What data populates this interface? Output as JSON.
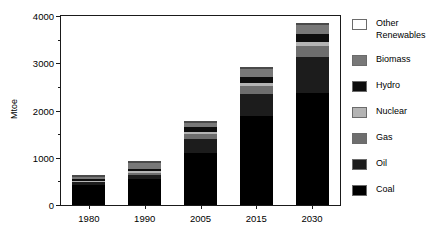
{
  "chart_data": {
    "type": "bar",
    "subtype": "stacked-bar",
    "title": "",
    "xlabel": "",
    "ylabel": "Mtoe",
    "ylim": [
      0,
      4000
    ],
    "yticks": [
      0,
      1000,
      2000,
      3000,
      4000
    ],
    "ytick_labels": [
      "0",
      "1000",
      "2000",
      "3000",
      "4000"
    ],
    "yminor_ticks": [
      500,
      1500,
      2500,
      3500
    ],
    "grid": false,
    "legend_position": "right",
    "categories": [
      "1980",
      "1990",
      "2005",
      "2015",
      "2030"
    ],
    "series": [
      {
        "name": "Coal",
        "color": "#000000",
        "values": [
          430,
          560,
          1100,
          1880,
          2380
        ]
      },
      {
        "name": "Oil",
        "color": "#1c1c1c",
        "values": [
          60,
          85,
          300,
          460,
          760
        ]
      },
      {
        "name": "Gas",
        "color": "#6e6e6e",
        "values": [
          20,
          40,
          110,
          180,
          230
        ]
      },
      {
        "name": "Nuclear",
        "color": "#b4b4b4",
        "values": [
          5,
          25,
          45,
          70,
          90
        ]
      },
      {
        "name": "Hydro",
        "color": "#0d0d0d",
        "values": [
          45,
          60,
          100,
          120,
          150
        ]
      },
      {
        "name": "Biomass",
        "color": "#787878",
        "values": [
          40,
          120,
          90,
          160,
          200
        ]
      },
      {
        "name": "Other Renewables",
        "color": "#ffffff",
        "values": [
          5,
          10,
          15,
          30,
          50
        ]
      }
    ],
    "totals": [
      605,
      900,
      1760,
      2900,
      3860
    ]
  },
  "legend": {
    "items": [
      {
        "label": "Other\nRenewables",
        "name": "other-renewables"
      },
      {
        "label": "Biomass",
        "name": "biomass"
      },
      {
        "label": "Hydro",
        "name": "hydro"
      },
      {
        "label": "Nuclear",
        "name": "nuclear"
      },
      {
        "label": "Gas",
        "name": "gas"
      },
      {
        "label": "Oil",
        "name": "oil"
      },
      {
        "label": "Coal",
        "name": "coal"
      }
    ]
  }
}
